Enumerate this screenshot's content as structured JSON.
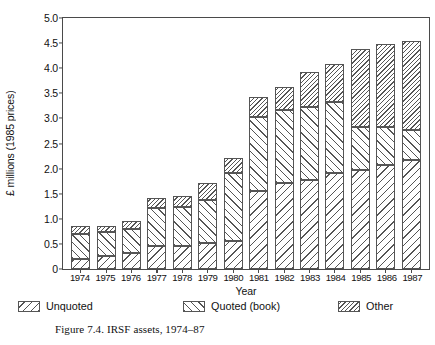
{
  "chart_data": {
    "type": "bar",
    "stacked": true,
    "title": "",
    "xlabel": "Year",
    "ylabel": "£ millions (1985 prices)",
    "ylim": [
      0,
      5.0
    ],
    "ytick_labels": [
      "0",
      "0.5",
      "1.0",
      "1.5",
      "2.0",
      "2.5",
      "3.0",
      "3.5",
      "4.0",
      "4.5",
      "5.0"
    ],
    "ytick_values": [
      0,
      0.5,
      1.0,
      1.5,
      2.0,
      2.5,
      3.0,
      3.5,
      4.0,
      4.5,
      5.0
    ],
    "grid": false,
    "legend_position": "bottom",
    "categories": [
      "1974",
      "1975",
      "1976",
      "1977",
      "1978",
      "1979",
      "1980",
      "1981",
      "1982",
      "1983",
      "1984",
      "1985",
      "1986",
      "1987"
    ],
    "series": [
      {
        "name": "Unquoted",
        "hatch": "backslash",
        "values": [
          0.2,
          0.25,
          0.32,
          0.45,
          0.45,
          0.52,
          0.55,
          1.55,
          1.7,
          1.75,
          1.9,
          1.95,
          2.05,
          2.15
        ]
      },
      {
        "name": "Quoted (book)",
        "hatch": "slash",
        "values": [
          0.5,
          0.48,
          0.47,
          0.75,
          0.78,
          0.85,
          1.35,
          1.45,
          1.45,
          1.45,
          1.4,
          0.85,
          0.75,
          0.6
        ]
      },
      {
        "name": "Other",
        "hatch": "dense-backslash",
        "values": [
          0.15,
          0.12,
          0.16,
          0.2,
          0.22,
          0.33,
          0.3,
          0.4,
          0.45,
          0.7,
          0.75,
          1.55,
          1.65,
          1.75
        ]
      }
    ],
    "totals": [
      0.85,
      0.85,
      0.95,
      1.4,
      1.45,
      1.7,
      2.2,
      3.4,
      3.6,
      3.9,
      4.05,
      4.35,
      4.45,
      4.5
    ],
    "caption": "Figure 7.4. IRSF assets, 1974–87"
  },
  "colors": {
    "axis": "#4a4a4a",
    "hatch": "#555555",
    "background": "#ffffff",
    "text": "#111111"
  }
}
